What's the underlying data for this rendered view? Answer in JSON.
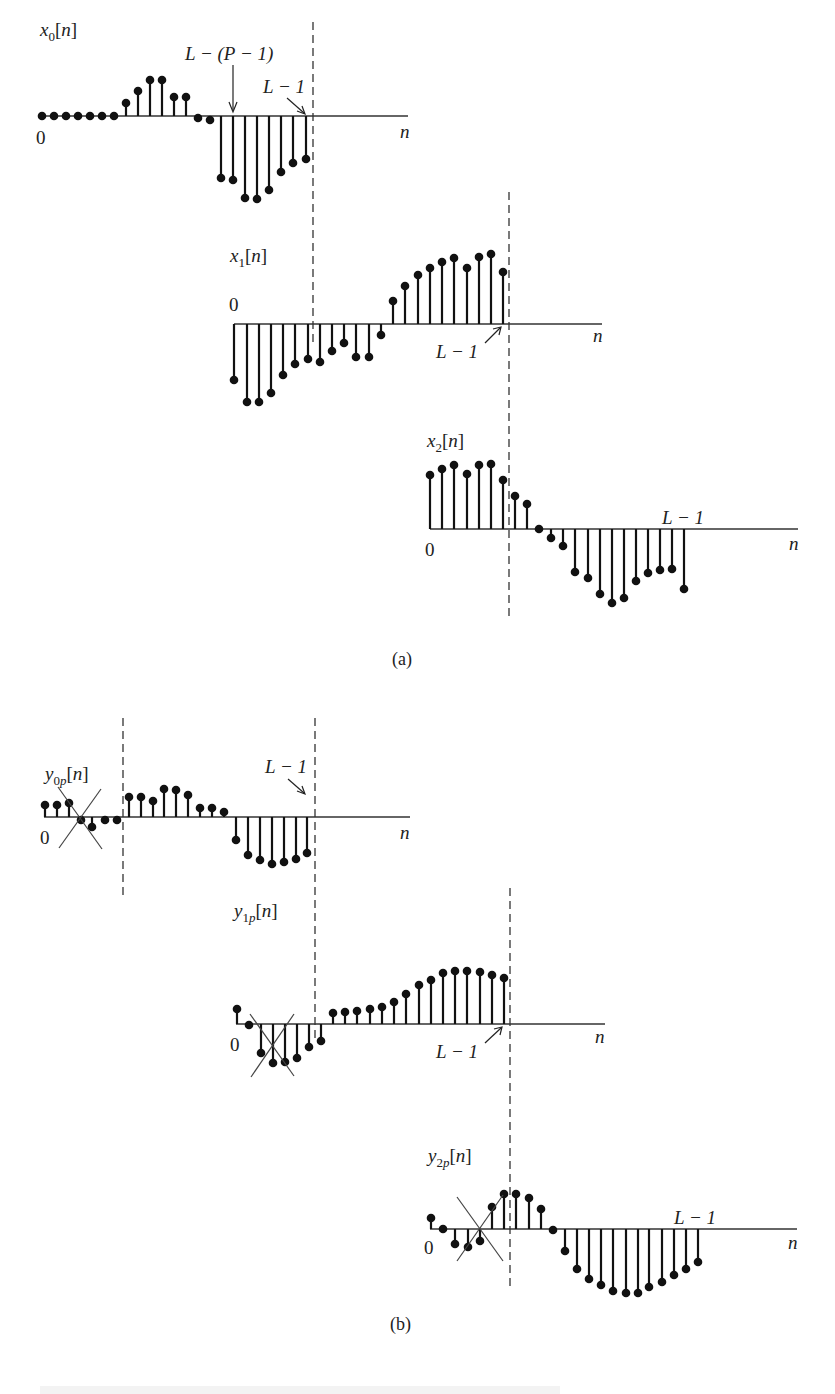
{
  "figure": {
    "panel_a_label": "(a)",
    "panel_b_label": "(b)",
    "axis_var": "n",
    "zero_label": "0",
    "marker_lm1": "L − 1",
    "marker_lp1": "L − (P − 1)"
  },
  "chart_data": [
    {
      "type": "stem",
      "name": "x0",
      "label_base": "x",
      "label_sub": "0",
      "label_arg": "[n]",
      "axis_y": 116,
      "axis_x": [
        38,
        408
      ],
      "x": [
        42,
        54,
        66,
        78,
        90,
        102,
        114,
        126,
        138,
        150,
        162,
        174,
        186,
        198,
        210,
        221,
        233,
        245,
        257,
        269,
        281,
        293,
        306
      ],
      "y": [
        116,
        116,
        116,
        116,
        116,
        116,
        116,
        103,
        91,
        80,
        80,
        97,
        97,
        118,
        120,
        178,
        180,
        198,
        199,
        190,
        172,
        163,
        159
      ]
    },
    {
      "type": "stem",
      "name": "x1",
      "label_base": "x",
      "label_sub": "1",
      "label_arg": "[n]",
      "axis_y": 324,
      "axis_x": [
        234,
        602
      ],
      "x": [
        234,
        247,
        259,
        271,
        283,
        295,
        308,
        320,
        332,
        344,
        356,
        369,
        381,
        393,
        405,
        418,
        430,
        442,
        454,
        467,
        479,
        491,
        503
      ],
      "y": [
        380,
        402,
        402,
        393,
        375,
        364,
        359,
        362,
        351,
        343,
        357,
        357,
        335,
        301,
        286,
        275,
        268,
        262,
        258,
        268,
        257,
        254,
        272
      ]
    },
    {
      "type": "stem",
      "name": "x2",
      "label_base": "x",
      "label_sub": "2",
      "label_arg": "[n]",
      "axis_y": 529,
      "axis_x": [
        430,
        798
      ],
      "x": [
        430,
        442,
        454,
        467,
        479,
        491,
        503,
        515,
        527,
        539,
        551,
        563,
        575,
        588,
        600,
        612,
        624,
        636,
        648,
        660,
        672,
        684
      ],
      "y": [
        475,
        469,
        465,
        474,
        465,
        464,
        480,
        496,
        504,
        529,
        538,
        546,
        572,
        578,
        594,
        603,
        598,
        581,
        573,
        570,
        569,
        589
      ]
    },
    {
      "type": "stem",
      "name": "y0p",
      "label_base": "y",
      "label_sub": "0p",
      "label_arg": "[n]",
      "axis_y": 817,
      "axis_x": [
        44,
        410
      ],
      "x": [
        45,
        57,
        69,
        81,
        92,
        105,
        117,
        129,
        141,
        153,
        164,
        176,
        188,
        200,
        212,
        224,
        236,
        248,
        260,
        272,
        284,
        296,
        307
      ],
      "y": [
        805,
        805,
        803,
        820,
        827,
        820,
        820,
        797,
        797,
        801,
        789,
        790,
        795,
        808,
        808,
        812,
        840,
        855,
        860,
        864,
        862,
        859,
        853
      ],
      "discard_cross": [
        [
          58,
          787,
          102,
          849
        ],
        [
          59,
          848,
          101,
          789
        ]
      ]
    },
    {
      "type": "stem",
      "name": "y1p",
      "label_base": "y",
      "label_sub": "1p",
      "label_arg": "[n]",
      "axis_y": 1024,
      "axis_x": [
        236,
        605
      ],
      "x": [
        237,
        249,
        261,
        273,
        285,
        297,
        309,
        321,
        333,
        345,
        357,
        370,
        382,
        394,
        406,
        419,
        431,
        443,
        455,
        467,
        480,
        492,
        504
      ],
      "y": [
        1009,
        1025,
        1053,
        1063,
        1062,
        1058,
        1047,
        1041,
        1013,
        1012,
        1011,
        1009,
        1007,
        1002,
        994,
        985,
        980,
        973,
        971,
        971,
        972,
        975,
        978
      ],
      "discard_cross": [
        [
          250,
          1014,
          294,
          1076
        ],
        [
          251,
          1077,
          294,
          1014
        ]
      ]
    },
    {
      "type": "stem",
      "name": "y2p",
      "label_base": "y",
      "label_sub": "2p",
      "label_arg": "[n]",
      "axis_y": 1229,
      "axis_x": [
        430,
        797
      ],
      "x": [
        431,
        443,
        455,
        468,
        480,
        492,
        504,
        516,
        529,
        541,
        553,
        565,
        577,
        589,
        601,
        613,
        626,
        638,
        649,
        662,
        674,
        686,
        698
      ],
      "y": [
        1218,
        1229,
        1244,
        1247,
        1241,
        1207,
        1194,
        1194,
        1198,
        1209,
        1230,
        1251,
        1269,
        1279,
        1285,
        1291,
        1293,
        1293,
        1287,
        1282,
        1275,
        1269,
        1262
      ],
      "discard_cross": [
        [
          457,
          1197,
          503,
          1261
        ],
        [
          457,
          1261,
          503,
          1195
        ]
      ]
    }
  ],
  "dashed_lines": [
    [
      313,
      22,
      313,
      345
    ],
    [
      509,
      192,
      509,
      617
    ],
    [
      123,
      718,
      123,
      895
    ],
    [
      315,
      718,
      315,
      1042
    ],
    [
      510,
      888,
      510,
      1288
    ]
  ]
}
